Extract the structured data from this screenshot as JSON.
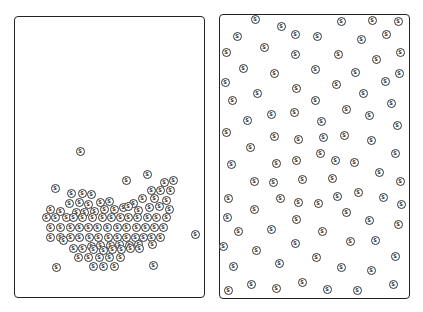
{
  "symbol": "S",
  "panels": [
    {
      "id": "left",
      "description": "clustered arrangement",
      "coins": [
        [
          80,
          151
        ],
        [
          55,
          188
        ],
        [
          126,
          180
        ],
        [
          147,
          174
        ],
        [
          164,
          182
        ],
        [
          173,
          180
        ],
        [
          195,
          234
        ],
        [
          56,
          267
        ],
        [
          153,
          265
        ],
        [
          71,
          193
        ],
        [
          82,
          193
        ],
        [
          91,
          194
        ],
        [
          151,
          190
        ],
        [
          160,
          190
        ],
        [
          170,
          190
        ],
        [
          69,
          203
        ],
        [
          79,
          202
        ],
        [
          88,
          204
        ],
        [
          100,
          202
        ],
        [
          109,
          201
        ],
        [
          123,
          207
        ],
        [
          133,
          203
        ],
        [
          142,
          198
        ],
        [
          154,
          198
        ],
        [
          166,
          200
        ],
        [
          50,
          209
        ],
        [
          60,
          211
        ],
        [
          76,
          212
        ],
        [
          84,
          212
        ],
        [
          94,
          211
        ],
        [
          104,
          209
        ],
        [
          114,
          209
        ],
        [
          128,
          206
        ],
        [
          138,
          210
        ],
        [
          149,
          207
        ],
        [
          159,
          206
        ],
        [
          169,
          209
        ],
        [
          46,
          217
        ],
        [
          55,
          217
        ],
        [
          66,
          217
        ],
        [
          73,
          217
        ],
        [
          82,
          217
        ],
        [
          92,
          217
        ],
        [
          102,
          217
        ],
        [
          111,
          217
        ],
        [
          120,
          217
        ],
        [
          128,
          217
        ],
        [
          137,
          217
        ],
        [
          147,
          217
        ],
        [
          156,
          217
        ],
        [
          166,
          217
        ],
        [
          50,
          227
        ],
        [
          60,
          227
        ],
        [
          70,
          227
        ],
        [
          79,
          227
        ],
        [
          88,
          227
        ],
        [
          97,
          227
        ],
        [
          107,
          227
        ],
        [
          117,
          227
        ],
        [
          126,
          227
        ],
        [
          136,
          227
        ],
        [
          145,
          227
        ],
        [
          154,
          227
        ],
        [
          163,
          227
        ],
        [
          50,
          237
        ],
        [
          60,
          237
        ],
        [
          70,
          237
        ],
        [
          79,
          237
        ],
        [
          89,
          237
        ],
        [
          98,
          237
        ],
        [
          108,
          237
        ],
        [
          117,
          237
        ],
        [
          126,
          237
        ],
        [
          135,
          237
        ],
        [
          143,
          237
        ],
        [
          151,
          237
        ],
        [
          160,
          237
        ],
        [
          63,
          240
        ],
        [
          91,
          246
        ],
        [
          100,
          245
        ],
        [
          110,
          245
        ],
        [
          119,
          244
        ],
        [
          129,
          245
        ],
        [
          138,
          244
        ],
        [
          152,
          244
        ],
        [
          73,
          248
        ],
        [
          82,
          248
        ],
        [
          93,
          249
        ],
        [
          103,
          250
        ],
        [
          112,
          249
        ],
        [
          121,
          249
        ],
        [
          130,
          248
        ],
        [
          139,
          248
        ],
        [
          78,
          257
        ],
        [
          88,
          257
        ],
        [
          99,
          257
        ],
        [
          109,
          257
        ],
        [
          120,
          257
        ],
        [
          93,
          266
        ],
        [
          103,
          266
        ],
        [
          114,
          266
        ]
      ]
    },
    {
      "id": "right",
      "description": "scattered arrangement",
      "coins": [
        [
          255,
          19
        ],
        [
          281,
          26
        ],
        [
          341,
          21
        ],
        [
          372,
          20
        ],
        [
          398,
          21
        ],
        [
          237,
          36
        ],
        [
          295,
          34
        ],
        [
          317,
          36
        ],
        [
          361,
          39
        ],
        [
          386,
          34
        ],
        [
          226,
          52
        ],
        [
          264,
          47
        ],
        [
          295,
          54
        ],
        [
          338,
          54
        ],
        [
          376,
          59
        ],
        [
          400,
          52
        ],
        [
          243,
          68
        ],
        [
          274,
          73
        ],
        [
          315,
          69
        ],
        [
          355,
          72
        ],
        [
          399,
          73
        ],
        [
          225,
          82
        ],
        [
          296,
          88
        ],
        [
          336,
          84
        ],
        [
          385,
          81
        ],
        [
          257,
          93
        ],
        [
          363,
          93
        ],
        [
          232,
          100
        ],
        [
          315,
          100
        ],
        [
          391,
          103
        ],
        [
          271,
          114
        ],
        [
          294,
          112
        ],
        [
          346,
          109
        ],
        [
          369,
          115
        ],
        [
          247,
          120
        ],
        [
          321,
          121
        ],
        [
          397,
          125
        ],
        [
          226,
          132
        ],
        [
          274,
          136
        ],
        [
          298,
          139
        ],
        [
          323,
          137
        ],
        [
          344,
          135
        ],
        [
          371,
          140
        ],
        [
          250,
          147
        ],
        [
          320,
          153
        ],
        [
          395,
          153
        ],
        [
          231,
          164
        ],
        [
          276,
          163
        ],
        [
          296,
          160
        ],
        [
          335,
          160
        ],
        [
          354,
          162
        ],
        [
          379,
          172
        ],
        [
          254,
          181
        ],
        [
          273,
          182
        ],
        [
          302,
          179
        ],
        [
          332,
          178
        ],
        [
          400,
          181
        ],
        [
          228,
          198
        ],
        [
          280,
          198
        ],
        [
          298,
          202
        ],
        [
          318,
          203
        ],
        [
          337,
          196
        ],
        [
          358,
          192
        ],
        [
          383,
          197
        ],
        [
          401,
          204
        ],
        [
          254,
          209
        ],
        [
          227,
          217
        ],
        [
          296,
          219
        ],
        [
          346,
          212
        ],
        [
          369,
          220
        ],
        [
          398,
          224
        ],
        [
          238,
          231
        ],
        [
          271,
          229
        ],
        [
          322,
          231
        ],
        [
          223,
          246
        ],
        [
          295,
          243
        ],
        [
          350,
          241
        ],
        [
          375,
          240
        ],
        [
          256,
          250
        ],
        [
          395,
          256
        ],
        [
          233,
          266
        ],
        [
          279,
          263
        ],
        [
          316,
          257
        ],
        [
          341,
          267
        ],
        [
          371,
          270
        ],
        [
          251,
          284
        ],
        [
          302,
          282
        ],
        [
          393,
          284
        ],
        [
          228,
          290
        ],
        [
          276,
          288
        ],
        [
          327,
          289
        ],
        [
          357,
          290
        ]
      ]
    }
  ]
}
